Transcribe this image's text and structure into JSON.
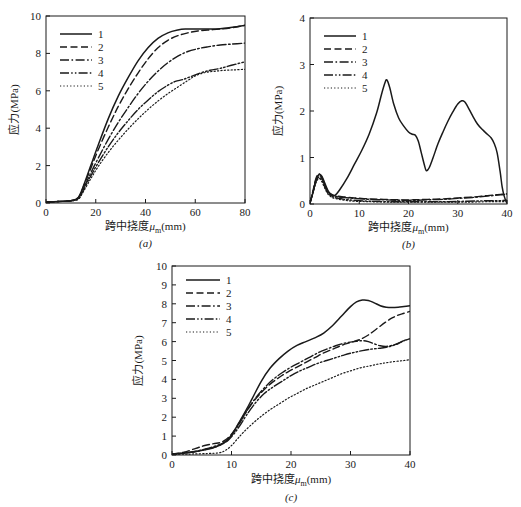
{
  "figure": {
    "caption_a": "(a)",
    "caption_b": "(b)",
    "caption_c": "(c)",
    "line_color": "#1a1a1a",
    "background": "#ffffff"
  },
  "labels": {
    "ylabel": "应力(MPa)",
    "xlabel_prefix": "跨中挠度",
    "xlabel_symbol": "μ",
    "xlabel_subscript": "m",
    "xlabel_suffix": "(mm)"
  },
  "legend": {
    "entries": [
      {
        "label": "1",
        "style": "solid"
      },
      {
        "label": "2",
        "style": "dashed"
      },
      {
        "label": "3",
        "style": "dashdot"
      },
      {
        "label": "4",
        "style": "dashdotdot"
      },
      {
        "label": "5",
        "style": "dotted"
      }
    ]
  },
  "chart_data": [
    {
      "id": "a",
      "type": "line",
      "title": "(a)",
      "xlabel": "跨中挠度μm(mm)",
      "ylabel": "应力(MPa)",
      "xlim": [
        0,
        80
      ],
      "ylim": [
        0,
        10
      ],
      "xticks": [
        0,
        20,
        40,
        60,
        80
      ],
      "yticks": [
        0,
        2,
        4,
        6,
        8,
        10
      ],
      "grid": false,
      "legend_position": "upper-left",
      "series": [
        {
          "name": "1",
          "style": "solid",
          "x": [
            0,
            5,
            10,
            13,
            15,
            18,
            21,
            25,
            29,
            33,
            37,
            41,
            45,
            49,
            53,
            56,
            60,
            65,
            70,
            75,
            80
          ],
          "y": [
            0.05,
            0.08,
            0.12,
            0.3,
            0.9,
            2.0,
            3.1,
            4.5,
            5.7,
            6.7,
            7.6,
            8.3,
            8.8,
            9.1,
            9.25,
            9.3,
            9.3,
            9.3,
            9.32,
            9.4,
            9.5
          ]
        },
        {
          "name": "2",
          "style": "dashed",
          "x": [
            0,
            5,
            10,
            13,
            15,
            18,
            21,
            25,
            29,
            33,
            37,
            41,
            45,
            49,
            53,
            57,
            61,
            65,
            70,
            75,
            80
          ],
          "y": [
            0.05,
            0.08,
            0.12,
            0.28,
            0.85,
            1.85,
            2.85,
            4.05,
            5.15,
            6.1,
            6.95,
            7.7,
            8.3,
            8.7,
            8.95,
            9.1,
            9.2,
            9.25,
            9.3,
            9.38,
            9.5
          ]
        },
        {
          "name": "3",
          "style": "dashdot",
          "x": [
            0,
            5,
            10,
            13,
            15,
            18,
            21,
            25,
            29,
            33,
            37,
            41,
            45,
            49,
            53,
            57,
            61,
            65,
            70,
            75,
            80
          ],
          "y": [
            0.05,
            0.08,
            0.12,
            0.25,
            0.75,
            1.6,
            2.4,
            3.4,
            4.3,
            5.1,
            5.85,
            6.5,
            7.05,
            7.5,
            7.85,
            8.1,
            8.25,
            8.35,
            8.45,
            8.5,
            8.55
          ]
        },
        {
          "name": "4",
          "style": "dashdotdot",
          "x": [
            0,
            5,
            10,
            13,
            15,
            18,
            21,
            25,
            29,
            33,
            37,
            41,
            45,
            49,
            52,
            55,
            58,
            62,
            66,
            70,
            75,
            80
          ],
          "y": [
            0.05,
            0.08,
            0.12,
            0.22,
            0.68,
            1.45,
            2.15,
            3.0,
            3.75,
            4.4,
            5.0,
            5.5,
            5.95,
            6.3,
            6.5,
            6.6,
            6.75,
            6.95,
            7.1,
            7.2,
            7.38,
            7.55
          ]
        },
        {
          "name": "5",
          "style": "dotted",
          "x": [
            0,
            5,
            10,
            13,
            15,
            18,
            21,
            25,
            29,
            33,
            37,
            41,
            45,
            49,
            53,
            57,
            60,
            64,
            68,
            72,
            76,
            80
          ],
          "y": [
            0.05,
            0.08,
            0.12,
            0.2,
            0.6,
            1.3,
            1.95,
            2.7,
            3.35,
            3.95,
            4.5,
            5.0,
            5.45,
            5.85,
            6.2,
            6.55,
            6.8,
            6.98,
            7.05,
            7.1,
            7.12,
            7.15
          ]
        }
      ]
    },
    {
      "id": "b",
      "type": "line",
      "title": "(b)",
      "xlabel": "跨中挠度μm(mm)",
      "ylabel": "应力(MPa)",
      "xlim": [
        0,
        40
      ],
      "ylim": [
        0,
        4
      ],
      "xticks": [
        0,
        10,
        20,
        30,
        40
      ],
      "yticks": [
        0,
        1,
        2,
        3,
        4
      ],
      "grid": false,
      "legend_position": "upper-left",
      "series": [
        {
          "name": "1",
          "style": "solid",
          "x": [
            0,
            0.6,
            1.2,
            1.8,
            2.4,
            3.0,
            3.6,
            4.2,
            5.0,
            6.0,
            7.5,
            9.0,
            10.5,
            12.0,
            13.5,
            14.5,
            15.2,
            15.6,
            16.2,
            17.0,
            18.0,
            19.0,
            20.0,
            20.8,
            21.4,
            22.0,
            22.6,
            23.2,
            23.6,
            24.2,
            25.0,
            26.0,
            27.0,
            28.0,
            29.0,
            30.0,
            30.8,
            31.4,
            32.0,
            33.0,
            34.0,
            35.0,
            36.0,
            36.8,
            37.4,
            38.0,
            38.6,
            39.0,
            39.4,
            39.8,
            40.0
          ],
          "y": [
            0.02,
            0.25,
            0.5,
            0.63,
            0.6,
            0.45,
            0.3,
            0.2,
            0.18,
            0.3,
            0.55,
            0.85,
            1.15,
            1.5,
            1.95,
            2.35,
            2.6,
            2.67,
            2.5,
            2.15,
            1.85,
            1.68,
            1.55,
            1.5,
            1.48,
            1.35,
            1.1,
            0.85,
            0.72,
            0.78,
            1.0,
            1.3,
            1.55,
            1.78,
            1.98,
            2.15,
            2.22,
            2.2,
            2.1,
            1.9,
            1.72,
            1.6,
            1.5,
            1.42,
            1.3,
            1.1,
            0.7,
            0.38,
            0.18,
            0.06,
            0.03
          ]
        },
        {
          "name": "2",
          "style": "dashed",
          "x": [
            0,
            0.6,
            1.2,
            1.8,
            2.4,
            3.0,
            3.6,
            4.5,
            5.5,
            7.0,
            9.0,
            12.0,
            15.0,
            18.0,
            21.0,
            24.0,
            27.0,
            30.0,
            33.0,
            36.0,
            38.0,
            39.0,
            40.0
          ],
          "y": [
            0.02,
            0.28,
            0.55,
            0.65,
            0.58,
            0.42,
            0.28,
            0.2,
            0.17,
            0.15,
            0.13,
            0.11,
            0.1,
            0.09,
            0.09,
            0.1,
            0.11,
            0.13,
            0.15,
            0.18,
            0.2,
            0.21,
            0.22
          ]
        },
        {
          "name": "3",
          "style": "dashdot",
          "x": [
            0,
            0.6,
            1.2,
            1.8,
            2.4,
            3.0,
            3.6,
            4.5,
            5.5,
            7.0,
            9.0,
            12.0,
            15.0,
            18.0,
            21.0,
            24.0,
            27.0,
            30.0,
            33.0,
            36.0,
            38.0,
            39.0,
            40.0
          ],
          "y": [
            0.02,
            0.26,
            0.52,
            0.62,
            0.56,
            0.4,
            0.26,
            0.19,
            0.16,
            0.14,
            0.12,
            0.1,
            0.09,
            0.08,
            0.08,
            0.09,
            0.1,
            0.12,
            0.14,
            0.17,
            0.19,
            0.2,
            0.21
          ]
        },
        {
          "name": "4",
          "style": "dashdotdot",
          "x": [
            0,
            0.6,
            1.2,
            1.8,
            2.4,
            3.0,
            3.6,
            4.5,
            5.5,
            7.0,
            9.0,
            12.0,
            16.0,
            20.0,
            24.0,
            28.0,
            32.0,
            36.0,
            38.0,
            40.0
          ],
          "y": [
            0.02,
            0.24,
            0.48,
            0.58,
            0.52,
            0.37,
            0.24,
            0.16,
            0.13,
            0.1,
            0.08,
            0.06,
            0.05,
            0.05,
            0.05,
            0.05,
            0.06,
            0.07,
            0.07,
            0.08
          ]
        },
        {
          "name": "5",
          "style": "dotted",
          "x": [
            0,
            0.6,
            1.2,
            1.8,
            2.4,
            3.0,
            3.6,
            4.5,
            5.5,
            7.0,
            9.0,
            12.0,
            16.0,
            20.0,
            24.0,
            28.0,
            32.0,
            36.0,
            38.0,
            40.0
          ],
          "y": [
            0.02,
            0.22,
            0.45,
            0.55,
            0.48,
            0.34,
            0.22,
            0.14,
            0.11,
            0.08,
            0.06,
            0.05,
            0.04,
            0.04,
            0.04,
            0.04,
            0.04,
            0.05,
            0.05,
            0.05
          ]
        }
      ]
    },
    {
      "id": "c",
      "type": "line",
      "title": "(c)",
      "xlabel": "跨中挠度μm(mm)",
      "ylabel": "应力(MPa)",
      "xlim": [
        0,
        40
      ],
      "ylim": [
        0,
        10
      ],
      "xticks": [
        0,
        10,
        20,
        30,
        40
      ],
      "yticks": [
        0,
        1,
        2,
        3,
        4,
        5,
        6,
        7,
        8,
        9,
        10
      ],
      "grid": false,
      "legend_position": "upper-left",
      "series": [
        {
          "name": "1",
          "style": "solid",
          "x": [
            0,
            2,
            4,
            6,
            7.5,
            8.5,
            9.5,
            10.5,
            11.5,
            12.5,
            13.5,
            15,
            16.5,
            18,
            19.5,
            21,
            22.5,
            24,
            25.5,
            27,
            28.5,
            30,
            31,
            32,
            33,
            34,
            35,
            36,
            37,
            38,
            39,
            40
          ],
          "y": [
            0.05,
            0.1,
            0.18,
            0.3,
            0.45,
            0.6,
            0.85,
            1.3,
            1.85,
            2.4,
            3.0,
            3.9,
            4.6,
            5.1,
            5.5,
            5.8,
            6.0,
            6.2,
            6.45,
            6.85,
            7.35,
            7.85,
            8.1,
            8.2,
            8.18,
            8.05,
            7.9,
            7.82,
            7.8,
            7.82,
            7.86,
            7.9
          ]
        },
        {
          "name": "2",
          "style": "dashed",
          "x": [
            0,
            2,
            4,
            5.5,
            7,
            8,
            9,
            10,
            11,
            12,
            13.5,
            15,
            16.5,
            18,
            19.5,
            21,
            22.5,
            24,
            25.5,
            27,
            28.5,
            30,
            31.5,
            33,
            34.5,
            36,
            37,
            38,
            39,
            40
          ],
          "y": [
            0.05,
            0.15,
            0.35,
            0.5,
            0.6,
            0.65,
            0.8,
            1.1,
            1.55,
            2.05,
            2.75,
            3.3,
            3.75,
            4.1,
            4.4,
            4.65,
            4.9,
            5.15,
            5.4,
            5.6,
            5.8,
            5.95,
            6.1,
            6.35,
            6.7,
            7.05,
            7.25,
            7.4,
            7.5,
            7.6
          ]
        },
        {
          "name": "3",
          "style": "dashdot",
          "x": [
            0,
            2,
            4,
            6,
            7.5,
            8.5,
            9.5,
            10.5,
            11.5,
            12.5,
            14,
            15.5,
            17,
            18.5,
            20,
            21.5,
            23,
            24.5,
            26,
            27.5,
            29,
            30.5,
            32,
            33,
            34,
            35,
            36,
            37,
            38,
            39,
            40
          ],
          "y": [
            0.05,
            0.1,
            0.2,
            0.35,
            0.5,
            0.62,
            0.85,
            1.25,
            1.75,
            2.3,
            3.0,
            3.55,
            4.0,
            4.35,
            4.65,
            4.9,
            5.15,
            5.4,
            5.6,
            5.78,
            5.92,
            6.0,
            6.05,
            6.0,
            5.88,
            5.78,
            5.75,
            5.8,
            5.9,
            6.05,
            6.15
          ]
        },
        {
          "name": "4",
          "style": "dashdotdot",
          "x": [
            0,
            2,
            4,
            6,
            7.5,
            8.5,
            9.5,
            10.5,
            11.5,
            12.5,
            14,
            15.5,
            17,
            18.5,
            20,
            21.5,
            23,
            24.5,
            26,
            27.5,
            29,
            30.5,
            32,
            33.5,
            35,
            36,
            37,
            38,
            39,
            40
          ],
          "y": [
            0.05,
            0.1,
            0.18,
            0.32,
            0.45,
            0.58,
            0.8,
            1.15,
            1.6,
            2.1,
            2.75,
            3.25,
            3.6,
            3.9,
            4.2,
            4.45,
            4.65,
            4.85,
            5.0,
            5.15,
            5.3,
            5.42,
            5.52,
            5.6,
            5.65,
            5.7,
            5.78,
            5.9,
            6.05,
            6.15
          ]
        },
        {
          "name": "5",
          "style": "dotted",
          "x": [
            0,
            3,
            6,
            8,
            9,
            10,
            11,
            12,
            13.5,
            15,
            16.5,
            18,
            19.5,
            21,
            22.5,
            24,
            25.5,
            27,
            28.5,
            30,
            31.5,
            33,
            34.5,
            36,
            37.5,
            39,
            40
          ],
          "y": [
            0.03,
            0.05,
            0.08,
            0.12,
            0.25,
            0.5,
            0.85,
            1.2,
            1.65,
            2.05,
            2.4,
            2.7,
            3.0,
            3.25,
            3.5,
            3.7,
            3.9,
            4.1,
            4.3,
            4.45,
            4.6,
            4.7,
            4.8,
            4.88,
            4.95,
            5.0,
            5.05
          ]
        }
      ]
    }
  ]
}
